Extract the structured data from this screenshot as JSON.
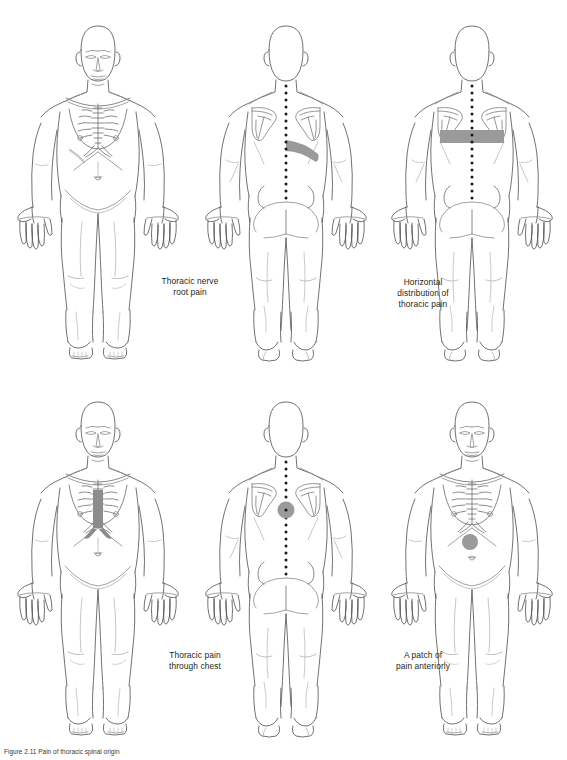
{
  "plate": {
    "title": "Thoracic pain distribution patterns",
    "caption_line": "Figure 2.11   Pain of thoracic spinal origin",
    "view_anterior": "anterior",
    "view_posterior": "posterior"
  },
  "colors": {
    "outline": "#4d4d4d",
    "detail": "#8a8a8a",
    "pain_fill": "#9a9a9a",
    "pain_fill_dark": "#8c8c8c",
    "spine_dots": "#1a1a1a",
    "background": "#ffffff",
    "text": "#231f20"
  },
  "figures": [
    {
      "id": "fig-1",
      "view": "anterior",
      "position": "top-left",
      "markings": [
        "sternal-ribcage-detail"
      ],
      "has_spine_dots": false
    },
    {
      "id": "fig-2",
      "view": "posterior",
      "position": "top-center",
      "markings": [
        "oblique-band-right-mid-back"
      ],
      "has_spine_dots": true
    },
    {
      "id": "fig-3",
      "view": "posterior",
      "position": "top-right",
      "markings": [
        "horizontal-band-upper-back"
      ],
      "has_spine_dots": true
    },
    {
      "id": "fig-4",
      "view": "anterior",
      "position": "bottom-left",
      "markings": [
        "vertical-sternal-patch"
      ],
      "has_spine_dots": false
    },
    {
      "id": "fig-5",
      "view": "posterior",
      "position": "bottom-center",
      "markings": [
        "round-spot-mid-thoracic-spine"
      ],
      "has_spine_dots": true
    },
    {
      "id": "fig-6",
      "view": "anterior",
      "position": "bottom-right",
      "markings": [
        "round-patch-epigastric"
      ],
      "has_spine_dots": false
    }
  ],
  "captions": [
    {
      "id": "caption-thoracic-nerve-root-pain",
      "text": "Thoracic nerve\nroot pain",
      "describes": "fig-2"
    },
    {
      "id": "caption-horizontal-distribution",
      "text": "Horizontal\ndistribution of\nthoracic pain",
      "describes": "fig-3"
    },
    {
      "id": "caption-thoracic-pain-through-chest",
      "text": "Thoracic pain\nthrough chest",
      "describes": "fig-5"
    },
    {
      "id": "caption-patch-of-pain-anteriorly",
      "text": "A patch of\npain anteriorly",
      "describes": "fig-6"
    }
  ]
}
